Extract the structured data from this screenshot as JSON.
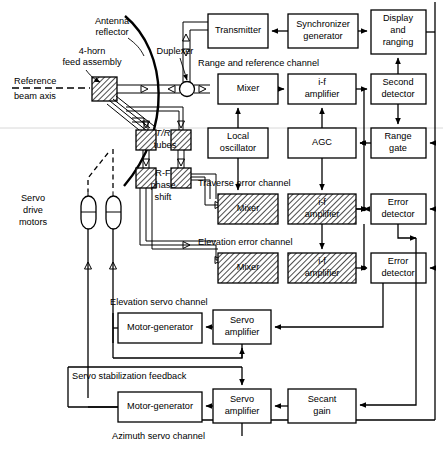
{
  "diagram": {
    "antenna": {
      "reflector_label_line1": "Antenna",
      "reflector_label_line2": "reflector",
      "feed_label_line1": "4-horn",
      "feed_label_line2": "feed assembly",
      "duplexer_label": "Duplexer",
      "reference_axis_line1": "Reference",
      "reference_axis_line2": "beam axis"
    },
    "rf_components": {
      "tr_tubes_line1": "T/R",
      "tr_tubes_line2": "tubes",
      "phase_shift_line1": "R-F",
      "phase_shift_line2": "phase",
      "phase_shift_line3": "shift",
      "servo_motors_line1": "Servo",
      "servo_motors_line2": "drive",
      "servo_motors_line3": "motors"
    },
    "channel_labels": {
      "range_reference": "Range and reference channel",
      "traverse_error": "Traverse error  channel",
      "elevation_error": "Elevation error  channel",
      "elevation_servo": "Elevation servo channel",
      "azimuth_servo": "Azimuth servo channel",
      "servo_stabilization": "Servo stabilization feedback"
    },
    "blocks": [
      {
        "id": "transmitter",
        "label_lines": [
          "Transmitter"
        ]
      },
      {
        "id": "synchronizer",
        "label_lines": [
          "Synchronizer",
          "generator"
        ]
      },
      {
        "id": "display",
        "label_lines": [
          "Display",
          "and",
          "ranging"
        ]
      },
      {
        "id": "mixer-range",
        "label_lines": [
          "Mixer"
        ]
      },
      {
        "id": "if-range",
        "label_lines": [
          "i-f",
          "amplifier"
        ]
      },
      {
        "id": "second-detector",
        "label_lines": [
          "Second",
          "detector"
        ]
      },
      {
        "id": "local-oscillator",
        "label_lines": [
          "Local",
          "oscillator"
        ]
      },
      {
        "id": "agc",
        "label_lines": [
          "AGC"
        ]
      },
      {
        "id": "range-gate",
        "label_lines": [
          "Range",
          "gate"
        ]
      },
      {
        "id": "mixer-traverse",
        "label_lines": [
          "Mixer"
        ]
      },
      {
        "id": "if-traverse",
        "label_lines": [
          "i-f",
          "amplifier"
        ]
      },
      {
        "id": "error-detector-traverse",
        "label_lines": [
          "Error",
          "detector"
        ]
      },
      {
        "id": "mixer-elevation",
        "label_lines": [
          "Mixer"
        ]
      },
      {
        "id": "if-elevation",
        "label_lines": [
          "i-f",
          "amplifier"
        ]
      },
      {
        "id": "error-detector-elevation",
        "label_lines": [
          "Error",
          "detector"
        ]
      },
      {
        "id": "motor-gen-elev",
        "label_lines": [
          "Motor-generator"
        ]
      },
      {
        "id": "servo-amp-elev",
        "label_lines": [
          "Servo",
          "amplifier"
        ]
      },
      {
        "id": "motor-gen-azim",
        "label_lines": [
          "Motor-generator"
        ]
      },
      {
        "id": "servo-amp-azim",
        "label_lines": [
          "Servo",
          "amplifier"
        ]
      },
      {
        "id": "secant-gain",
        "label_lines": [
          "Secant",
          "gain"
        ]
      }
    ],
    "colors": {
      "line": "#000000",
      "block_fill": "#ffffff",
      "background": "#ffffff"
    }
  }
}
